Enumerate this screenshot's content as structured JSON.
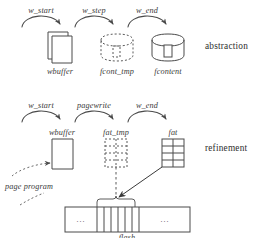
{
  "diagram": {
    "ink_color": "#4a4a4a",
    "text_color": "#333333",
    "tiers": [
      {
        "id": "abstraction",
        "label": "abstraction"
      },
      {
        "id": "refinement",
        "label": "refinement"
      }
    ],
    "abstraction_row": {
      "transitions": [
        {
          "name": "w_start"
        },
        {
          "name": "w_step"
        },
        {
          "name": "w_end"
        }
      ],
      "states": [
        {
          "name": "wbuffer",
          "shape": "stacked-pages",
          "style": "solid"
        },
        {
          "name": "fcont_tmp",
          "shape": "cylinder",
          "style": "dashed"
        },
        {
          "name": "fcontent",
          "shape": "cylinder",
          "style": "solid"
        }
      ]
    },
    "refinement_row": {
      "transitions": [
        {
          "name": "w_start"
        },
        {
          "name": "pagewrite"
        },
        {
          "name": "w_end"
        }
      ],
      "states": [
        {
          "name": "wbuffer",
          "shape": "stacked-pages",
          "style": "solid"
        },
        {
          "name": "fat_tmp",
          "shape": "grid-table",
          "style": "dashed"
        },
        {
          "name": "fat",
          "shape": "grid-table",
          "style": "solid"
        }
      ]
    },
    "operations": [
      {
        "name": "page program",
        "style": "dashed-arrow"
      }
    ],
    "storage": {
      "name": "flash",
      "cells": [
        {
          "content": "..."
        },
        {
          "content": ""
        },
        {
          "content": ""
        },
        {
          "content": ""
        },
        {
          "content": ""
        },
        {
          "content": ""
        },
        {
          "content": "..."
        }
      ]
    }
  }
}
